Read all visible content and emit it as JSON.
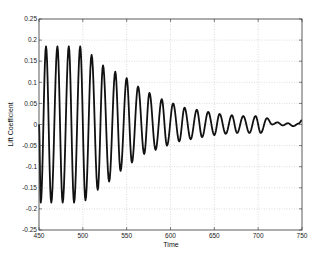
{
  "chart_data": {
    "type": "line",
    "title": "",
    "xlabel": "Time",
    "ylabel": "Lift Coefficient",
    "xlim": [
      450,
      750
    ],
    "ylim": [
      -0.25,
      0.25
    ],
    "grid": true,
    "legend": null,
    "x_ticks": [
      450,
      500,
      550,
      600,
      650,
      700,
      750
    ],
    "y_ticks": [
      -0.25,
      -0.2,
      -0.15,
      -0.1,
      -0.05,
      0,
      0.05,
      0.1,
      0.15,
      0.2,
      0.25
    ],
    "x_tick_labels": [
      "450",
      "500",
      "550",
      "600",
      "650",
      "700",
      "750"
    ],
    "y_tick_labels": [
      "-0.25",
      "-0.2",
      "-0.15",
      "-0.1",
      "-0.05",
      "0",
      "0.05",
      "0.1",
      "0.15",
      "0.2",
      "0.25"
    ],
    "series": [
      {
        "name": "Lift Coefficient",
        "color": "#111111",
        "description": "Oscillating lift coefficient, period ~13 time units, constant amplitude ~0.185 from t=450 to ~505, then decaying toward ~0.01 by t~720 with small irregular fluctuations until 750",
        "peaks": [
          {
            "x": 458,
            "y": 0.185
          },
          {
            "x": 471,
            "y": 0.185
          },
          {
            "x": 484,
            "y": 0.185
          },
          {
            "x": 497,
            "y": 0.185
          },
          {
            "x": 510,
            "y": 0.165
          },
          {
            "x": 523,
            "y": 0.14
          },
          {
            "x": 537,
            "y": 0.125
          },
          {
            "x": 550,
            "y": 0.11
          },
          {
            "x": 563,
            "y": 0.09
          },
          {
            "x": 576,
            "y": 0.075
          },
          {
            "x": 590,
            "y": 0.06
          },
          {
            "x": 603,
            "y": 0.05
          },
          {
            "x": 616,
            "y": 0.04
          },
          {
            "x": 630,
            "y": 0.035
          },
          {
            "x": 643,
            "y": 0.03
          },
          {
            "x": 656,
            "y": 0.025
          },
          {
            "x": 670,
            "y": 0.022
          },
          {
            "x": 683,
            "y": 0.02
          },
          {
            "x": 697,
            "y": 0.02
          },
          {
            "x": 710,
            "y": 0.015
          }
        ],
        "troughs": [
          {
            "x": 452,
            "y": -0.185
          },
          {
            "x": 464,
            "y": -0.185
          },
          {
            "x": 477,
            "y": -0.185
          },
          {
            "x": 490,
            "y": -0.185
          },
          {
            "x": 503,
            "y": -0.18
          },
          {
            "x": 517,
            "y": -0.155
          },
          {
            "x": 530,
            "y": -0.135
          },
          {
            "x": 543,
            "y": -0.11
          },
          {
            "x": 556,
            "y": -0.09
          },
          {
            "x": 570,
            "y": -0.07
          },
          {
            "x": 583,
            "y": -0.06
          },
          {
            "x": 596,
            "y": -0.05
          },
          {
            "x": 610,
            "y": -0.04
          },
          {
            "x": 623,
            "y": -0.035
          },
          {
            "x": 636,
            "y": -0.03
          },
          {
            "x": 650,
            "y": -0.025
          },
          {
            "x": 663,
            "y": -0.022
          },
          {
            "x": 676,
            "y": -0.02
          },
          {
            "x": 690,
            "y": -0.02
          },
          {
            "x": 703,
            "y": -0.02
          }
        ],
        "tail": [
          {
            "x": 716,
            "y": 0.0
          },
          {
            "x": 722,
            "y": 0.005
          },
          {
            "x": 728,
            "y": -0.002
          },
          {
            "x": 734,
            "y": 0.003
          },
          {
            "x": 740,
            "y": -0.004
          },
          {
            "x": 746,
            "y": 0.002
          },
          {
            "x": 750,
            "y": 0.01
          }
        ]
      }
    ]
  }
}
